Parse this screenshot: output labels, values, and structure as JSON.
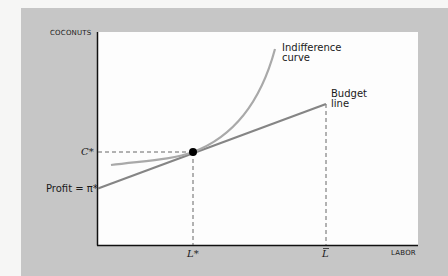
{
  "diagram": {
    "type": "economics-tangency",
    "axes": {
      "y_label": "COCONUTS",
      "x_label": "LABOR"
    },
    "curves": {
      "indifference_label_line1": "Indifference",
      "indifference_label_line2": "curve",
      "budget_label_line1": "Budget",
      "budget_label_line2": "line"
    },
    "markers": {
      "c_star": "C*",
      "profit_intercept": "Profit = π*",
      "l_star": "L*",
      "l_bar": "L"
    },
    "colors": {
      "panel": "#c6c6c6",
      "plot_bg": "#fdfdfd",
      "indifference_curve": "#a9a9a9",
      "budget_line": "#858585",
      "axes": "#111111",
      "dashed": "#555555",
      "tangency_point": "#000000"
    }
  }
}
